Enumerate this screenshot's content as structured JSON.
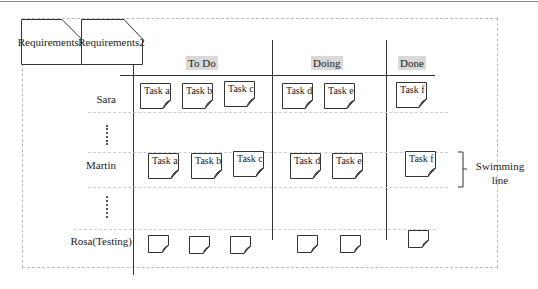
{
  "tabs": [
    "Requirements1",
    "Requirements2"
  ],
  "columns": [
    {
      "label": "To Do",
      "x": 200
    },
    {
      "label": "Doing",
      "x": 327
    },
    {
      "label": "Done",
      "x": 410
    }
  ],
  "rows": [
    {
      "label": "Sara",
      "y": 92
    },
    {
      "label": "Martin",
      "y": 159
    },
    {
      "label": "Rosa(Testing)",
      "y": 235
    }
  ],
  "tasks": {
    "sara": [
      "Task a",
      "Task b",
      "Task c",
      "Task d",
      "Task e",
      "Task f"
    ],
    "martin": [
      "Task a",
      "Task b",
      "Task c",
      "Task d",
      "Task e",
      "Task f"
    ]
  },
  "legend": {
    "line1": "Swimming",
    "line2": "line"
  },
  "colors": {
    "line": "#333333",
    "header_bg": "#d9d9d9",
    "dashed": "#cccccc"
  }
}
